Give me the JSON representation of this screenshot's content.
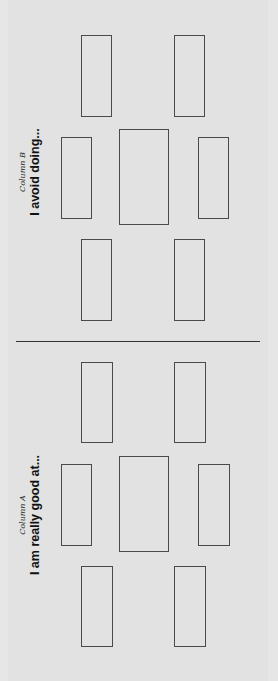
{
  "colors": {
    "line": "#4a4a4a",
    "background": "#e2e2e2",
    "text": "#111111"
  },
  "column_b": {
    "subtitle": "Column B",
    "heading": "I avoid doing...",
    "boxes": [
      {
        "x": 81,
        "y": 35,
        "w": 31,
        "h": 82
      },
      {
        "x": 174,
        "y": 35,
        "w": 31,
        "h": 82
      },
      {
        "x": 61,
        "y": 137,
        "w": 31,
        "h": 82
      },
      {
        "x": 119,
        "y": 129,
        "w": 50,
        "h": 96
      },
      {
        "x": 198,
        "y": 137,
        "w": 31,
        "h": 82
      },
      {
        "x": 81,
        "y": 239,
        "w": 31,
        "h": 82
      },
      {
        "x": 174,
        "y": 239,
        "w": 31,
        "h": 82
      }
    ]
  },
  "column_a": {
    "subtitle": "Column A",
    "heading": "I am really good at...",
    "boxes": [
      {
        "x": 81,
        "y": 362,
        "w": 32,
        "h": 81
      },
      {
        "x": 174,
        "y": 362,
        "w": 32,
        "h": 81
      },
      {
        "x": 61,
        "y": 464,
        "w": 31,
        "h": 82
      },
      {
        "x": 119,
        "y": 456,
        "w": 50,
        "h": 96
      },
      {
        "x": 198,
        "y": 464,
        "w": 32,
        "h": 82
      },
      {
        "x": 81,
        "y": 566,
        "w": 32,
        "h": 81
      },
      {
        "x": 174,
        "y": 566,
        "w": 32,
        "h": 81
      }
    ]
  }
}
